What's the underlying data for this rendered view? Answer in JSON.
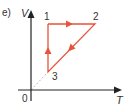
{
  "figure": {
    "part_label": "e)",
    "y_axis_label": "V",
    "x_axis_label": "T",
    "origin_label": "0",
    "points": [
      {
        "id": "1",
        "label": "1"
      },
      {
        "id": "2",
        "label": "2"
      },
      {
        "id": "3",
        "label": "3"
      }
    ],
    "cycle": [
      "1",
      "2",
      "3",
      "1"
    ],
    "cycle_color": "#e8533a",
    "axis_color": "#222222",
    "extension_line_color": "#bbbbbb"
  }
}
